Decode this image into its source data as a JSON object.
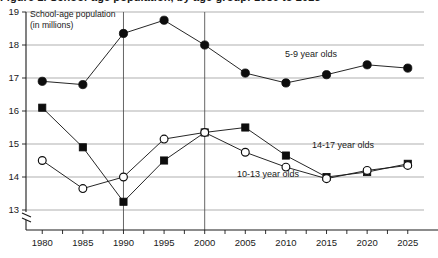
{
  "title": {
    "text": "Figure 1. School-age population, by age group: 1980 to 2025",
    "clipped": "true"
  },
  "annotation": {
    "line1": "School-age population",
    "line2": "(in millions)"
  },
  "axis": {
    "y_ticks": [
      "19",
      "18",
      "17",
      "16",
      "15",
      "14",
      "13"
    ],
    "x_ticks": [
      "1980",
      "1985",
      "1990",
      "1995",
      "2000",
      "2005",
      "2010",
      "2015",
      "2020",
      "2025"
    ],
    "break_symbol": "axis-break"
  },
  "series_labels": {
    "s59": "5-9 year olds",
    "s1417": "14-17 year olds",
    "s1013": "10-13 year olds"
  },
  "colors": {
    "ink": "#1a1a1a",
    "grid": "#8c8c8c",
    "marker": "#0d0d0d",
    "background": "#ffffff"
  },
  "chart_data": {
    "type": "line",
    "title": "School-age population, by age group: 1980 to 2025",
    "xlabel": "",
    "ylabel": "School-age population (in millions)",
    "x": [
      1980,
      1985,
      1990,
      1995,
      2000,
      2005,
      2010,
      2015,
      2020,
      2025
    ],
    "categories": [
      "1980",
      "1985",
      "1990",
      "1995",
      "2000",
      "2005",
      "2010",
      "2015",
      "2020",
      "2025"
    ],
    "ylim": [
      12.8,
      19.0
    ],
    "xlim": [
      1978,
      2027
    ],
    "y_ticks": [
      13,
      14,
      15,
      16,
      17,
      18,
      19
    ],
    "y_axis_break": true,
    "grid": "horizontal",
    "legend": "inline-labels",
    "reference_lines_x": [
      1990,
      2000
    ],
    "series": [
      {
        "name": "5-9 year olds",
        "marker": "filled-circle",
        "values": [
          16.9,
          16.8,
          18.35,
          18.75,
          18.0,
          17.15,
          16.85,
          17.1,
          17.4,
          17.3
        ]
      },
      {
        "name": "14-17 year olds",
        "marker": "filled-square",
        "values": [
          16.1,
          14.9,
          13.25,
          14.5,
          15.35,
          15.5,
          14.65,
          14.0,
          14.15,
          14.4
        ]
      },
      {
        "name": "10-13 year olds",
        "marker": "open-circle",
        "values": [
          14.5,
          13.65,
          14.0,
          15.15,
          15.35,
          14.75,
          14.3,
          13.95,
          14.2,
          14.35
        ]
      }
    ]
  }
}
